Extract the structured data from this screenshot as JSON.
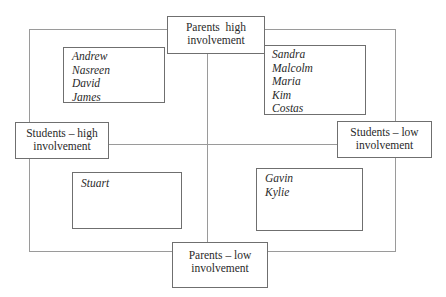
{
  "diagram": {
    "type": "quadrant",
    "axes": {
      "top": {
        "line1": "Parents  high",
        "line2": "involvement"
      },
      "bottom": {
        "line1": "Parents – low",
        "line2": "involvement"
      },
      "left": {
        "line1": "Students – high",
        "line2": "involvement"
      },
      "right": {
        "line1": "Students – low",
        "line2": "involvement"
      }
    },
    "quadrants": {
      "top_left": {
        "names": [
          "Andrew",
          "Nasreen",
          "David",
          "James"
        ]
      },
      "top_right": {
        "names": [
          "Sandra",
          "Malcolm",
          "Maria",
          "Kim",
          "Costas"
        ]
      },
      "bottom_left": {
        "names": [
          "Stuart"
        ]
      },
      "bottom_right": {
        "names": [
          "Gavin",
          "Kylie"
        ]
      }
    }
  }
}
